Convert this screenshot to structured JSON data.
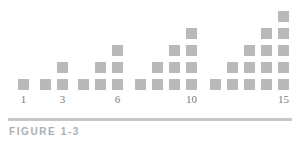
{
  "figure": {
    "caption": "FIGURE 1-3"
  },
  "chart_data": {
    "type": "bar",
    "title": "",
    "subtitle": "",
    "xlabel": "",
    "ylabel": "",
    "grid": false,
    "legend": null,
    "unit_marker": "square",
    "categories": [
      "1",
      "2",
      "3",
      "4",
      "5",
      "6",
      "7",
      "8",
      "9",
      "10",
      "11",
      "12",
      "13",
      "14",
      "15"
    ],
    "values": [
      1,
      1,
      2,
      1,
      2,
      3,
      1,
      2,
      3,
      4,
      1,
      2,
      3,
      4,
      5
    ],
    "ylim": [
      0,
      5
    ],
    "xtick_positions": [
      1,
      3,
      6,
      10,
      15
    ],
    "xtick_labels": [
      "1",
      "3",
      "6",
      "10",
      "15"
    ],
    "groups": [
      {
        "name": "group-1",
        "columns": [
          1
        ]
      },
      {
        "name": "group-2",
        "columns": [
          1,
          2
        ]
      },
      {
        "name": "group-3",
        "columns": [
          1,
          2,
          3
        ]
      },
      {
        "name": "group-4",
        "columns": [
          1,
          2,
          3,
          4
        ]
      },
      {
        "name": "group-5",
        "columns": [
          1,
          2,
          3,
          4,
          5
        ]
      }
    ],
    "colors": {
      "square": "#b9b9b9",
      "background": "#ffffff",
      "axis_label": "#7b7b7b",
      "caption_rule": "#c4c9cc",
      "caption_text": "#a9b0b5"
    },
    "geometry": {
      "square_size": 11,
      "column_x": [
        18,
        40,
        57,
        78,
        95,
        112,
        135,
        152,
        169,
        186,
        210,
        227,
        244,
        261,
        278
      ],
      "baseline_y": 79,
      "row_pitch": 17
    }
  }
}
